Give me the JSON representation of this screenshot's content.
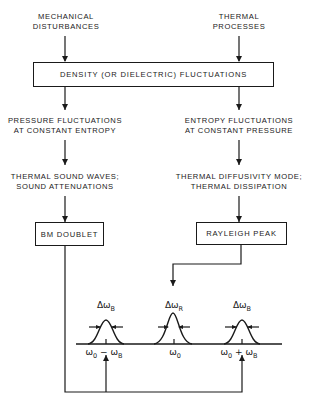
{
  "diagram": {
    "sources": {
      "mechanical": [
        "MECHANICAL",
        "DISTURBANCES"
      ],
      "thermal": [
        "THERMAL",
        "PROCESSES"
      ]
    },
    "central_box": "DENSITY (OR DIELECTRIC) FLUCTUATIONS",
    "left_branch": {
      "fluctuation": [
        "PRESSURE FLUCTUATIONS",
        "AT CONSTANT ENTROPY"
      ],
      "mode": [
        "THERMAL SOUND WAVES;",
        "SOUND ATTENUATIONS"
      ],
      "result_box": "BM DOUBLET"
    },
    "right_branch": {
      "fluctuation": [
        "ENTROPY FLUCTUATIONS",
        "AT CONSTANT PRESSURE"
      ],
      "mode": [
        "THERMAL DIFFUSIVITY MODE;",
        "THERMAL DISSIPATION"
      ],
      "result_box": "RAYLEIGH PEAK"
    },
    "spectrum": {
      "peaks": [
        {
          "width_label": "Δω",
          "width_sub": "B",
          "position_label": "ω",
          "position_sub": "0",
          "position_suffix": " − ω",
          "position_suffix_sub": "B"
        },
        {
          "width_label": "Δω",
          "width_sub": "R",
          "position_label": "ω",
          "position_sub": "0",
          "position_suffix": "",
          "position_suffix_sub": ""
        },
        {
          "width_label": "Δω",
          "width_sub": "B",
          "position_label": "ω",
          "position_sub": "0",
          "position_suffix": " + ω",
          "position_suffix_sub": "B"
        }
      ]
    }
  }
}
